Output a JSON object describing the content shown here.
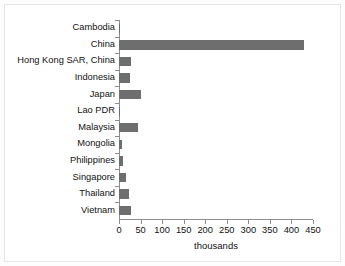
{
  "chart_data": {
    "type": "bar",
    "orientation": "horizontal",
    "title": "",
    "xlabel": "thousands",
    "ylabel": "",
    "categories": [
      "Cambodia",
      "China",
      "Hong Kong SAR, China",
      "Indonesia",
      "Japan",
      "Lao PDR",
      "Malaysia",
      "Mongolia",
      "Philippines",
      "Singapore",
      "Thailand",
      "Vietnam"
    ],
    "values": [
      3,
      429,
      28,
      26,
      50,
      2,
      43,
      7,
      9,
      17,
      24,
      27
    ],
    "xlim": [
      0,
      450
    ],
    "xticks": [
      0,
      50,
      100,
      150,
      200,
      250,
      300,
      350,
      400,
      450
    ],
    "xtick_labels": [
      "0",
      "50",
      "100",
      "150",
      "200",
      "250",
      "300",
      "350",
      "400",
      "450"
    ],
    "grid": false,
    "legend": null,
    "bar_color": "#6e6e6e",
    "axis_color": "#8d8d8d",
    "text_color": "#111111",
    "background_color": "#ffffff"
  }
}
